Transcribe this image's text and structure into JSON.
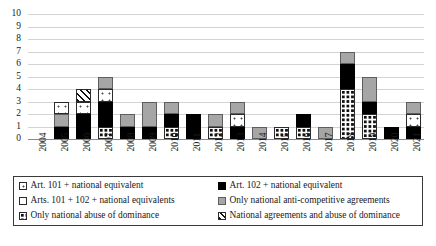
{
  "chart_data": {
    "type": "bar",
    "title": "",
    "xlabel": "",
    "ylabel": "",
    "ylim": [
      0,
      10
    ],
    "yticks": [
      0,
      1,
      2,
      3,
      4,
      5,
      6,
      7,
      8,
      9,
      10
    ],
    "grid": true,
    "stacked": true,
    "legend_position": "bottom",
    "categories": [
      "2004",
      "2005",
      "2006",
      "2007",
      "2008",
      "2009",
      "2010",
      "2011",
      "2012",
      "2013",
      "2014",
      "2015",
      "2016",
      "2017",
      "2018",
      "2019",
      "2020",
      "2021"
    ],
    "series": [
      {
        "name": "Art. 101 + national equivalent",
        "key": "art101",
        "values": [
          0,
          1,
          1,
          1,
          0,
          0,
          0,
          0,
          0,
          1,
          0,
          0,
          0,
          0,
          0,
          0,
          0,
          1
        ]
      },
      {
        "name": "Art. 102 + national equivalent",
        "key": "art102",
        "values": [
          0,
          1,
          2,
          2,
          1,
          1,
          1,
          2,
          0,
          1,
          0,
          0,
          1,
          0,
          2,
          1,
          1,
          1
        ]
      },
      {
        "name": "Arts. 101 + 102 + national equivalents",
        "key": "arts",
        "values": [
          0,
          0,
          0,
          0,
          0,
          0,
          0,
          0,
          0,
          0,
          0,
          0,
          0,
          0,
          0,
          0,
          0,
          0
        ]
      },
      {
        "name": "Only national anti-competitive agreements",
        "key": "agree",
        "values": [
          0,
          1,
          0,
          1,
          1,
          2,
          1,
          0,
          1,
          1,
          1,
          0,
          0,
          1,
          1,
          2,
          0,
          1
        ]
      },
      {
        "name": "Only national abuse of dominance",
        "key": "abuse",
        "values": [
          0,
          0,
          0,
          1,
          0,
          0,
          1,
          0,
          1,
          0,
          0,
          1,
          1,
          0,
          4,
          2,
          0,
          0
        ]
      },
      {
        "name": "National agreements  and abuse of dominance",
        "key": "hatch",
        "values": [
          0,
          0,
          1,
          0,
          0,
          0,
          0,
          0,
          0,
          0,
          0,
          0,
          0,
          0,
          0,
          0,
          0,
          0
        ]
      }
    ],
    "totals": [
      0,
      3,
      4,
      5,
      2,
      3,
      3,
      2,
      2,
      3,
      1,
      1,
      2,
      1,
      7,
      5,
      1,
      3
    ],
    "bar_stacks": [
      {
        "year": "2004",
        "segments": []
      },
      {
        "year": "2005",
        "segments": [
          {
            "key": "art102",
            "value": 1
          },
          {
            "key": "agree",
            "value": 1
          },
          {
            "key": "art101",
            "value": 1
          }
        ]
      },
      {
        "year": "2006",
        "segments": [
          {
            "key": "art102",
            "value": 2
          },
          {
            "key": "art101",
            "value": 1
          },
          {
            "key": "hatch",
            "value": 1
          }
        ]
      },
      {
        "year": "2007",
        "segments": [
          {
            "key": "abuse",
            "value": 1
          },
          {
            "key": "art102",
            "value": 2
          },
          {
            "key": "art101",
            "value": 1
          },
          {
            "key": "agree",
            "value": 1
          }
        ]
      },
      {
        "year": "2008",
        "segments": [
          {
            "key": "art102",
            "value": 1
          },
          {
            "key": "agree",
            "value": 1
          }
        ]
      },
      {
        "year": "2009",
        "segments": [
          {
            "key": "art102",
            "value": 1
          },
          {
            "key": "agree",
            "value": 2
          }
        ]
      },
      {
        "year": "2010",
        "segments": [
          {
            "key": "abuse",
            "value": 1
          },
          {
            "key": "art102",
            "value": 1
          },
          {
            "key": "agree",
            "value": 1
          }
        ]
      },
      {
        "year": "2011",
        "segments": [
          {
            "key": "art102",
            "value": 2
          }
        ]
      },
      {
        "year": "2012",
        "segments": [
          {
            "key": "abuse",
            "value": 1
          },
          {
            "key": "agree",
            "value": 1
          }
        ]
      },
      {
        "year": "2013",
        "segments": [
          {
            "key": "art102",
            "value": 1
          },
          {
            "key": "art101",
            "value": 1
          },
          {
            "key": "agree",
            "value": 1
          }
        ]
      },
      {
        "year": "2014",
        "segments": [
          {
            "key": "agree",
            "value": 1
          }
        ]
      },
      {
        "year": "2015",
        "segments": [
          {
            "key": "abuse",
            "value": 1
          }
        ]
      },
      {
        "year": "2016",
        "segments": [
          {
            "key": "abuse",
            "value": 1
          },
          {
            "key": "art102",
            "value": 1
          }
        ]
      },
      {
        "year": "2017",
        "segments": [
          {
            "key": "agree",
            "value": 1
          }
        ]
      },
      {
        "year": "2018",
        "segments": [
          {
            "key": "abuse",
            "value": 4
          },
          {
            "key": "art102",
            "value": 2
          },
          {
            "key": "agree",
            "value": 1
          }
        ]
      },
      {
        "year": "2019",
        "segments": [
          {
            "key": "abuse",
            "value": 2
          },
          {
            "key": "art102",
            "value": 1
          },
          {
            "key": "agree",
            "value": 2
          }
        ]
      },
      {
        "year": "2020",
        "segments": [
          {
            "key": "art102",
            "value": 1
          }
        ]
      },
      {
        "year": "2021",
        "segments": [
          {
            "key": "art102",
            "value": 1
          },
          {
            "key": "art101",
            "value": 1
          },
          {
            "key": "agree",
            "value": 1
          }
        ]
      }
    ],
    "legend": [
      {
        "label": "Art. 101 + national equivalent",
        "key": "art101"
      },
      {
        "label": "Art. 102 + national equivalent",
        "key": "art102"
      },
      {
        "label": "Arts. 101 + 102 + national equivalents",
        "key": "arts"
      },
      {
        "label": "Only national anti-competitive agreements",
        "key": "agree"
      },
      {
        "label": "Only national abuse of dominance",
        "key": "abuse"
      },
      {
        "label": "National agreements  and abuse of dominance",
        "key": "hatch"
      }
    ],
    "colors": {
      "art102": "#000000",
      "agree": "#a6a6a6",
      "background": "#ffffff",
      "gridline": "#d3d3d3",
      "axis": "#8a8a8a",
      "text": "#1a1a1a"
    }
  }
}
